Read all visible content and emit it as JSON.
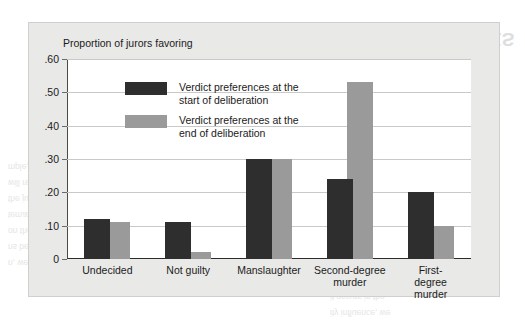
{
  "chart_data": {
    "type": "bar",
    "title": "",
    "ylabel": "Proportion of jurors favoring",
    "xlabel": "",
    "ylim": [
      0,
      0.6
    ],
    "grid": true,
    "legend_position": "upper-left inside plot",
    "categories": [
      "Undecided",
      "Not guilty",
      "Manslaughter",
      "Second-degree\nmurder",
      "First-degree\nmurder"
    ],
    "ytick_labels": [
      ".60",
      ".50",
      ".40",
      ".30",
      ".20",
      ".10",
      "0"
    ],
    "ytick_values": [
      0.6,
      0.5,
      0.4,
      0.3,
      0.2,
      0.1,
      0
    ],
    "series": [
      {
        "name": "Verdict preferences at the\nstart of deliberation",
        "color": "#2e2e2e",
        "values": [
          0.12,
          0.11,
          0.3,
          0.24,
          0.2
        ]
      },
      {
        "name": "Verdict preferences at the\nend of deliberation",
        "color": "#9a9a9a",
        "values": [
          0.11,
          0.02,
          0.3,
          0.53,
          0.1
        ]
      }
    ]
  },
  "ghost": {
    "heading_line1": "HOW DO GROUP INFLUENCES",
    "heading_line2": "AFFECT JURIES?",
    "body": [
      "individual jurors' views",
      "ups. Thus, we must",
      "rs on the individual",
      "ct the jury's ultimate",
      "ecision-making. They",
      "mple, we know that",
      "will reach a verdict",
      "the jury process. The",
      "tematic research that",
      "on the psychology of",
      "ns between the jury",
      "n, we consider what",
      "als than by juries",
      "it occurs in the",
      "ity influence, we",
      "roup influences",
      "ther members",
      "mbers of the"
    ]
  }
}
